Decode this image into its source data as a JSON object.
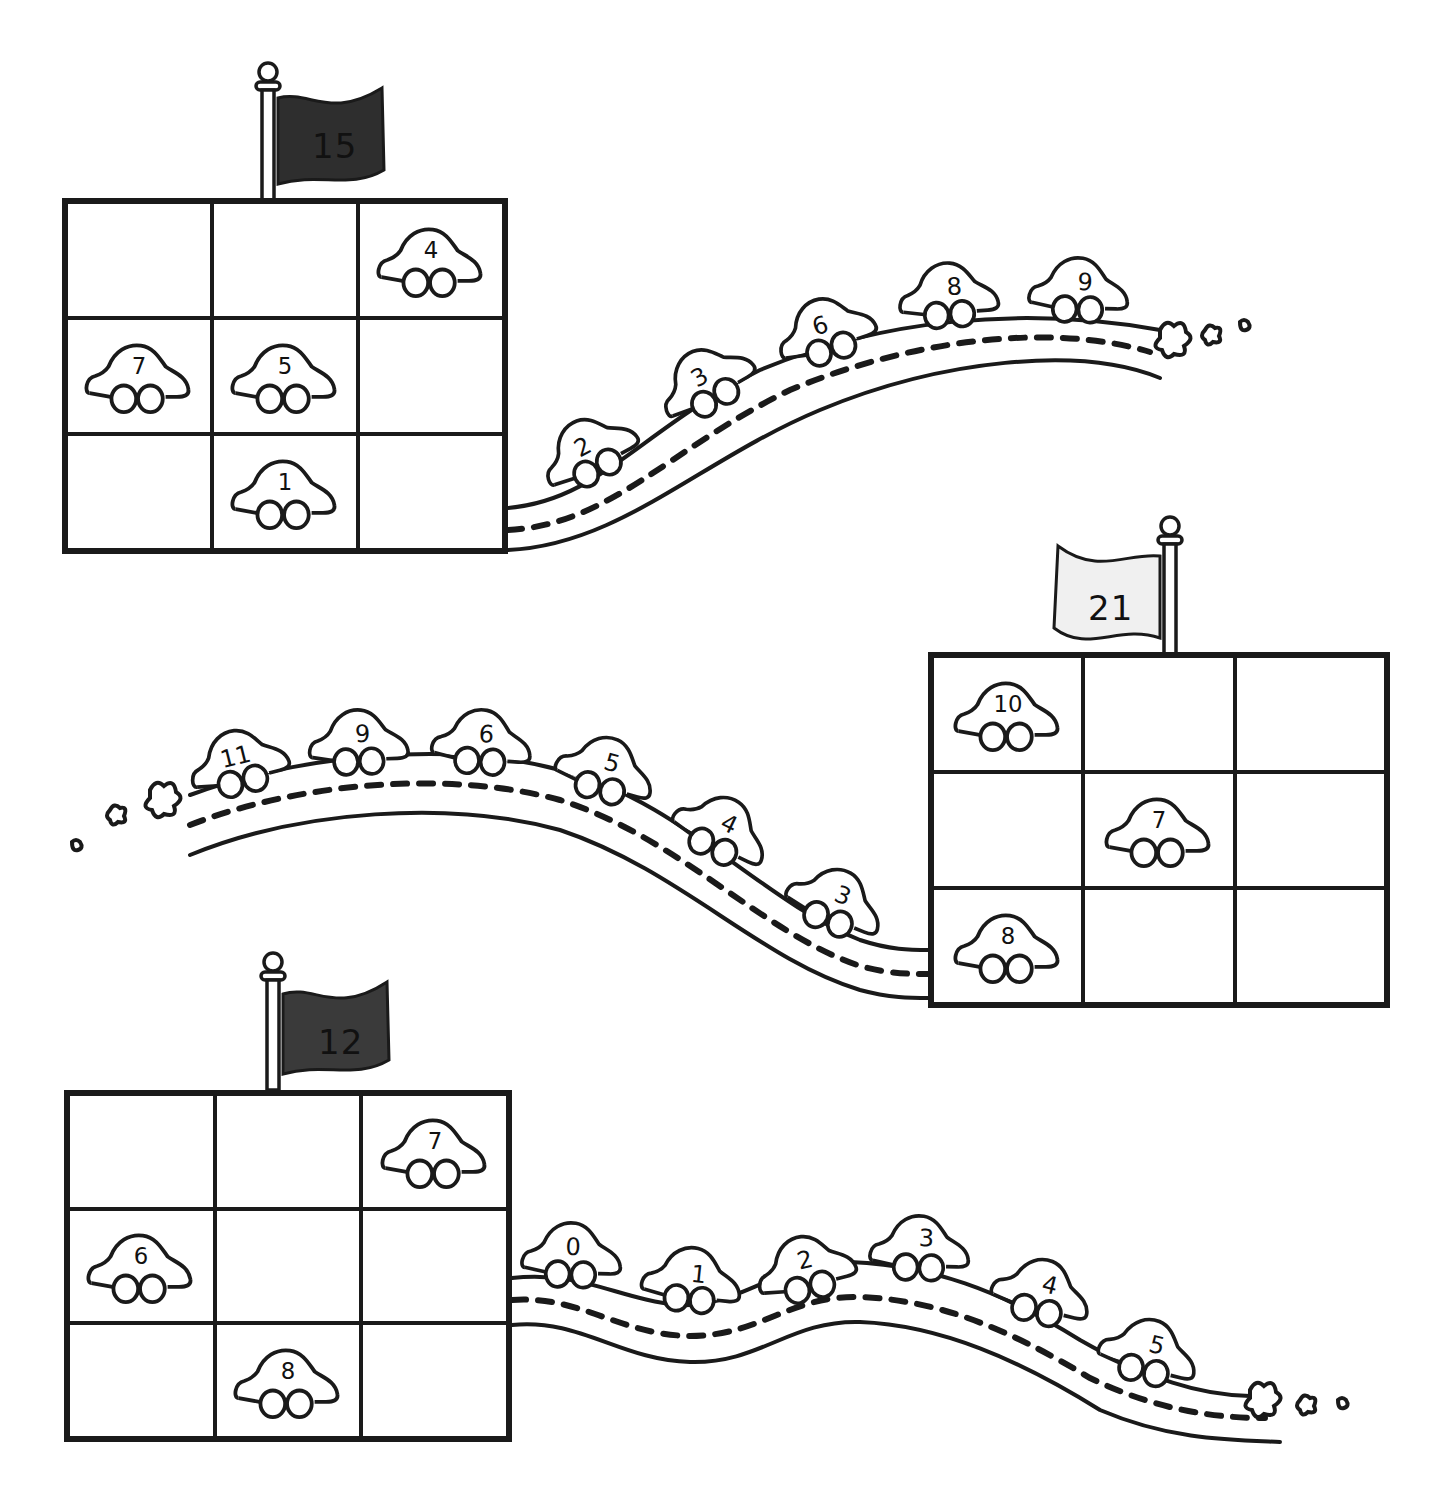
{
  "worksheet": {
    "puzzles": [
      {
        "id": "puzzle-1",
        "flag": {
          "number": "15",
          "fill": "#2e2e2e",
          "pole_side": "left"
        },
        "grid": [
          [
            "",
            "",
            "4"
          ],
          [
            "7",
            "5",
            ""
          ],
          [
            "",
            "1",
            ""
          ]
        ],
        "road_cars": [
          "2",
          "3",
          "6",
          "8",
          "9"
        ]
      },
      {
        "id": "puzzle-2",
        "flag": {
          "number": "21",
          "fill": "#f0f0f0",
          "pole_side": "right"
        },
        "grid": [
          [
            "10",
            "",
            ""
          ],
          [
            "",
            "7",
            ""
          ],
          [
            "8",
            "",
            ""
          ]
        ],
        "road_cars": [
          "11",
          "9",
          "6",
          "5",
          "4",
          "3"
        ]
      },
      {
        "id": "puzzle-3",
        "flag": {
          "number": "12",
          "fill": "#3a3a3a",
          "pole_side": "left"
        },
        "grid": [
          [
            "",
            "",
            "7"
          ],
          [
            "6",
            "",
            ""
          ],
          [
            "",
            "8",
            ""
          ]
        ],
        "road_cars": [
          "0",
          "1",
          "2",
          "3",
          "4",
          "5"
        ]
      }
    ],
    "colors": {
      "ink": "#1a1a1a",
      "paper": "#ffffff"
    }
  }
}
